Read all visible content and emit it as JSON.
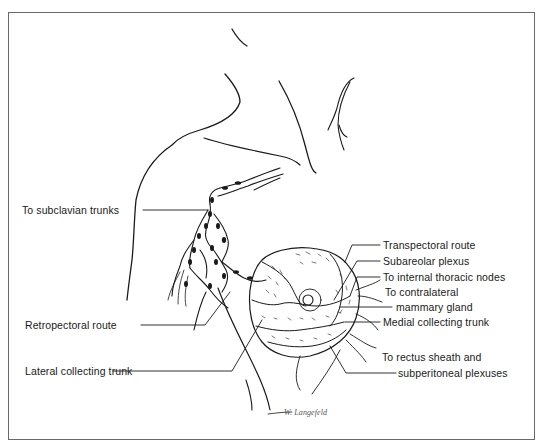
{
  "figure": {
    "signature": "W. Langefeld"
  },
  "labels": {
    "left": [
      {
        "text": "To subclavian trunks"
      },
      {
        "text": "Retropectoral route"
      },
      {
        "text": "Lateral collecting trunk"
      }
    ],
    "right": [
      {
        "text": "Transpectoral route"
      },
      {
        "text": "Subareolar plexus"
      },
      {
        "text": "To internal thoracic nodes"
      },
      {
        "text": "To contralateral"
      },
      {
        "text": "mammary gland"
      },
      {
        "text": "Medial collecting trunk"
      },
      {
        "text": "To rectus sheath and"
      },
      {
        "text": "subperitoneal plexuses"
      }
    ]
  },
  "colors": {
    "ink": "#1a1a1a",
    "frame": "#6a6a6a",
    "background": "#ffffff"
  }
}
